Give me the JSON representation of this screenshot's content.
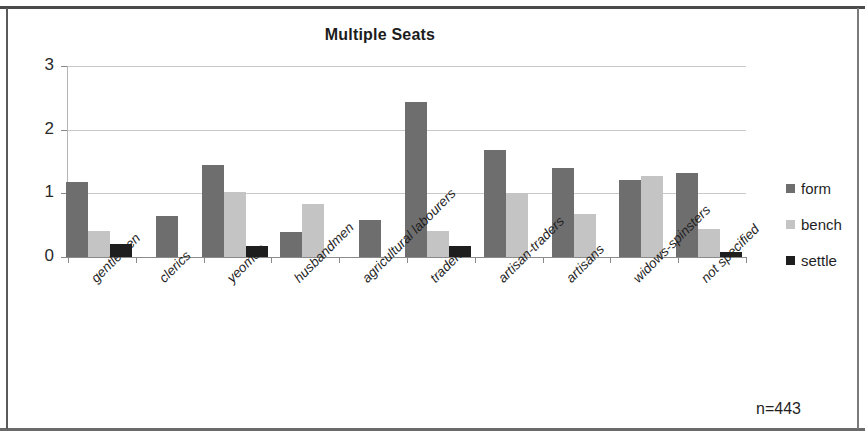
{
  "figure": {
    "title": "Multiple Seats",
    "sample_note": "n=443"
  },
  "axes": {
    "y_ticks": [
      "0",
      "1",
      "2",
      "3"
    ],
    "y_min": 0,
    "y_max": 3
  },
  "legend": {
    "position": "right",
    "entries": [
      {
        "label": "form",
        "color": "#6e6e6e",
        "key": "form"
      },
      {
        "label": "bench",
        "color": "#c4c4c4",
        "key": "bench"
      },
      {
        "label": "settle",
        "color": "#1e1e1e",
        "key": "settle"
      }
    ]
  },
  "chart_data": {
    "type": "bar",
    "title": "Multiple Seats",
    "subtitle": "",
    "xlabel": "",
    "ylabel": "",
    "ylim": [
      0,
      3
    ],
    "yticks": [
      0,
      1,
      2,
      3
    ],
    "grid": true,
    "legend_position": "right",
    "annotation": "n=443",
    "categories": [
      "gentlemen",
      "clerics",
      "yeomen",
      "husbandmen",
      "agricultural labourers",
      "traders",
      "artisan-traders",
      "artisans",
      "widows-spinsters",
      "not specified"
    ],
    "series": [
      {
        "name": "form",
        "color": "#6e6e6e",
        "values": [
          1.18,
          0.65,
          1.45,
          0.4,
          0.58,
          2.44,
          1.68,
          1.4,
          1.21,
          1.32
        ]
      },
      {
        "name": "bench",
        "color": "#c4c4c4",
        "values": [
          0.41,
          0,
          1.02,
          0.83,
          0,
          0.41,
          1.01,
          0.68,
          1.28,
          0.44
        ]
      },
      {
        "name": "settle",
        "color": "#1e1e1e",
        "values": [
          0.2,
          0,
          0.17,
          0,
          0,
          0.17,
          0,
          0,
          0,
          0.08
        ]
      }
    ]
  }
}
